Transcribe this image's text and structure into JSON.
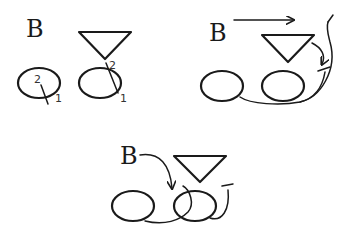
{
  "diagram": {
    "panels": [
      {
        "id": "panel-1",
        "letter": "B",
        "labels": {
          "left_top": "2",
          "left_bottom": "1",
          "right_top": "2",
          "right_bottom": "1"
        }
      },
      {
        "id": "panel-2",
        "letter": "B"
      },
      {
        "id": "panel-3",
        "letter": "B"
      }
    ],
    "colors": {
      "stroke": "#1a1a1a",
      "background": "#ffffff"
    }
  }
}
